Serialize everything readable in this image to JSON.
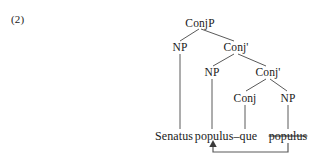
{
  "example": {
    "number_label": "(2)"
  },
  "tree": {
    "nodes": [
      {
        "id": "conjp",
        "label": "ConjP",
        "x": 200,
        "y": 23
      },
      {
        "id": "np1",
        "label": "NP",
        "x": 180,
        "y": 47
      },
      {
        "id": "conjbar1",
        "label": "Conj'",
        "x": 236,
        "y": 47
      },
      {
        "id": "np2",
        "label": "NP",
        "x": 212,
        "y": 72
      },
      {
        "id": "conjbar2",
        "label": "Conj'",
        "x": 268,
        "y": 72
      },
      {
        "id": "conj",
        "label": "Conj",
        "x": 245,
        "y": 98
      },
      {
        "id": "np3",
        "label": "NP",
        "x": 288,
        "y": 98
      }
    ],
    "leaves": [
      {
        "id": "leaf-senatus",
        "label": "Senatus",
        "x": 174,
        "y": 136,
        "struck": false
      },
      {
        "id": "leaf-populus-que",
        "label": "populus–que",
        "x": 226,
        "y": 136,
        "struck": false
      },
      {
        "id": "leaf-populus-trace",
        "label": "populus",
        "x": 288,
        "y": 136,
        "struck": true
      }
    ],
    "movement_arrow": {
      "from_label": "populus",
      "to_label": "populus–que",
      "description": "movement arrow from struck populus to NP position"
    },
    "line_color": "#5a5a5a"
  }
}
